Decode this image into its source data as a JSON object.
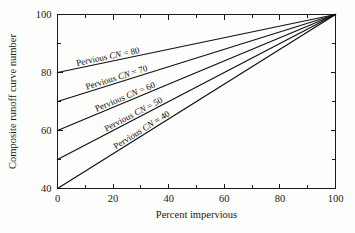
{
  "chart_data": {
    "type": "line",
    "title": "",
    "xlabel": "Percent impervious",
    "ylabel": "Composite runoff curve number",
    "xlim": [
      0,
      100
    ],
    "ylim": [
      40,
      100
    ],
    "grid": false,
    "legend_position": "inline-on-curves",
    "x_ticks_major": [
      0,
      20,
      40,
      60,
      80,
      100
    ],
    "x_ticks_minor": [
      10,
      30,
      50,
      70,
      90
    ],
    "y_ticks_major": [
      40,
      60,
      80,
      100
    ],
    "y_ticks_minor": [
      50,
      70,
      90
    ],
    "x_tick_labels": [
      "0",
      "20",
      "40",
      "60",
      "80",
      "100"
    ],
    "y_tick_labels": [
      "40",
      "60",
      "80",
      "100"
    ],
    "x": [
      0,
      100
    ],
    "series": [
      {
        "name": "Pervious CN = 80",
        "cn": 80,
        "values": [
          80,
          100
        ],
        "label_prefix": "Pervious ",
        "label_cn": "CN",
        "label_suffix": " = 80"
      },
      {
        "name": "Pervious CN = 70",
        "cn": 70,
        "values": [
          70,
          100
        ],
        "label_prefix": "Pervious ",
        "label_cn": "CN",
        "label_suffix": " = 70"
      },
      {
        "name": "Pervious CN = 60",
        "cn": 60,
        "values": [
          60,
          100
        ],
        "label_prefix": "Pervious ",
        "label_cn": "CN",
        "label_suffix": " = 60"
      },
      {
        "name": "Pervious CN = 50",
        "cn": 50,
        "values": [
          50,
          100
        ],
        "label_prefix": "Pervious ",
        "label_cn": "CN",
        "label_suffix": " = 50"
      },
      {
        "name": "Pervious CN = 40",
        "cn": 40,
        "values": [
          40,
          100
        ],
        "label_prefix": "Pervious ",
        "label_cn": "CN",
        "label_suffix": " = 40"
      }
    ],
    "colors": {
      "line": "#111111",
      "axis": "#1a1a1a",
      "background": "#fdfdfb",
      "text": "#1a1a1a"
    }
  }
}
